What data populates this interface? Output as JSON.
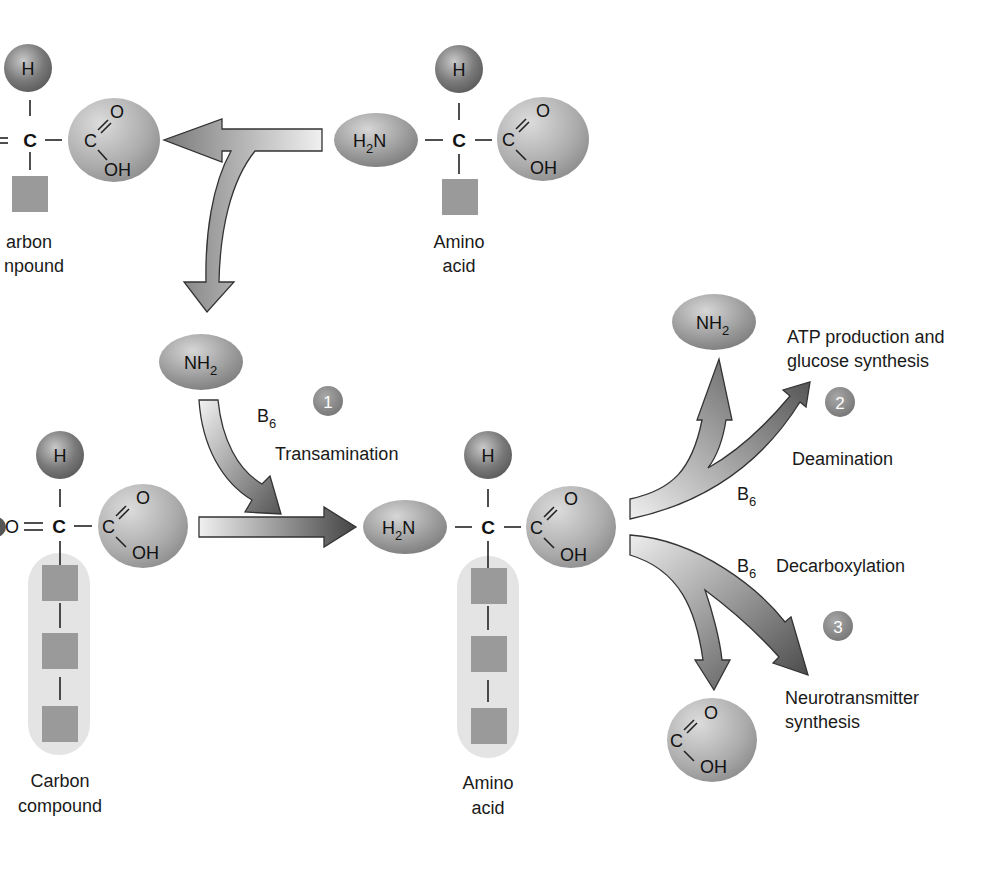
{
  "diagram": {
    "top_left_molecule": {
      "label_line1": "arbon",
      "label_line2": "npound",
      "atom_h": "H",
      "atom_c": "C",
      "carboxyl_c": "C",
      "carboxyl_o": "O",
      "carboxyl_oh": "OH"
    },
    "top_right_molecule": {
      "label_line1": "Amino",
      "label_line2": "acid",
      "amine": "H",
      "amine_sub": "2",
      "amine_n": "N",
      "atom_h": "H",
      "atom_c": "C",
      "carboxyl_c": "C",
      "carboxyl_o": "O",
      "carboxyl_oh": "OH"
    },
    "transamination": {
      "step_number": "1",
      "group": "NH",
      "group_sub": "2",
      "cofactor": "B",
      "cofactor_sub": "6",
      "label": "Transamination"
    },
    "bottom_left_molecule": {
      "label_line1": "Carbon",
      "label_line2": "compound",
      "atom_o": "O",
      "atom_h": "H",
      "atom_c": "C",
      "carboxyl_c": "C",
      "carboxyl_o": "O",
      "carboxyl_oh": "OH"
    },
    "bottom_center_molecule": {
      "label_line1": "Amino",
      "label_line2": "acid",
      "amine": "H",
      "amine_sub": "2",
      "amine_n": "N",
      "atom_h": "H",
      "atom_c": "C",
      "carboxyl_c": "C",
      "carboxyl_o": "O",
      "carboxyl_oh": "OH"
    },
    "deamination": {
      "step_number": "2",
      "product_group": "NH",
      "product_group_sub": "2",
      "outcome_line1": "ATP production and",
      "outcome_line2": "glucose synthesis",
      "label": "Deamination",
      "cofactor": "B",
      "cofactor_sub": "6"
    },
    "decarboxylation": {
      "step_number": "3",
      "cofactor": "B",
      "cofactor_sub": "6",
      "label": "Decarboxylation",
      "outcome_line1": "Neurotransmitter",
      "outcome_line2": "synthesis",
      "removed_c": "C",
      "removed_o": "O",
      "removed_oh": "OH"
    }
  },
  "colors": {
    "sphere_dark": "#6e6e6e",
    "sphere_light": "#c4c4c4",
    "side_chain_square": "#9a9a9a",
    "side_chain_bg": "#e4e4e4",
    "step_badge": "#8a8a8a",
    "arrow_light": "#eeeeee",
    "arrow_dark": "#444444"
  }
}
